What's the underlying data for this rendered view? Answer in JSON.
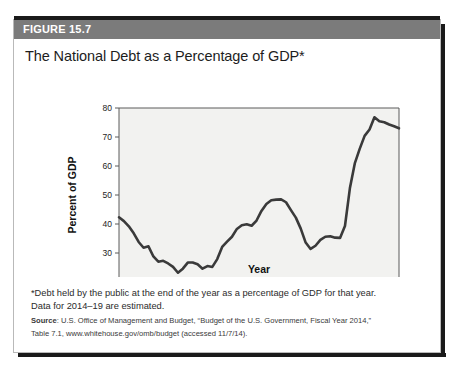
{
  "figure": {
    "label": "FIGURE 15.7",
    "title": "The National Debt as a Percentage of GDP*"
  },
  "footnote": {
    "line1": "*Debt held by the public at the end of the year as a percentage of GDP for that year.",
    "line2": "Data for 2014–19 are estimated.",
    "source_label": "Source",
    "source_rest": ": U.S. Office of Management and Budget, “Budget of the U.S. Government, Fiscal Year 2014,”",
    "source_line2": "Table 7.1, www.whitehouse.gov/omb/budget (accessed 11/7/14)."
  },
  "colors": {
    "header_bar": "#7b7b7b",
    "line": "#3a3a3a",
    "plot_bg": "#f2f2f0",
    "border": "#b9b9b9"
  },
  "chart_data": {
    "type": "line",
    "title": "The National Debt as a Percentage of GDP*",
    "xlabel": "Year",
    "ylabel": "Percent of GDP",
    "xlim": [
      1962,
      2019
    ],
    "ylim": [
      20,
      80
    ],
    "yticks": [
      20,
      30,
      40,
      50,
      60,
      70,
      80
    ],
    "xticks": [
      1962,
      1966,
      1970,
      1974,
      1978,
      1982,
      1986,
      1990,
      1994,
      1998,
      2002,
      2006,
      2010,
      2014,
      2019
    ],
    "grid": false,
    "legend": null,
    "series": [
      {
        "name": "Debt held by the public as % of GDP",
        "x": [
          1962,
          1963,
          1964,
          1965,
          1966,
          1967,
          1968,
          1969,
          1970,
          1971,
          1972,
          1973,
          1974,
          1975,
          1976,
          1977,
          1978,
          1979,
          1980,
          1981,
          1982,
          1983,
          1984,
          1985,
          1986,
          1987,
          1988,
          1989,
          1990,
          1991,
          1992,
          1993,
          1994,
          1995,
          1996,
          1997,
          1998,
          1999,
          2000,
          2001,
          2002,
          2003,
          2004,
          2005,
          2006,
          2007,
          2008,
          2009,
          2010,
          2011,
          2012,
          2013,
          2014,
          2015,
          2016,
          2017,
          2018,
          2019
        ],
        "values": [
          42.3,
          41.0,
          39.2,
          36.8,
          33.8,
          31.8,
          32.3,
          28.8,
          27.0,
          27.3,
          26.4,
          25.2,
          23.2,
          24.6,
          26.7,
          26.7,
          26.1,
          24.6,
          25.5,
          25.2,
          27.9,
          32.1,
          33.9,
          35.6,
          38.3,
          39.6,
          39.9,
          39.4,
          41.2,
          44.5,
          46.9,
          48.2,
          48.4,
          48.5,
          47.5,
          44.8,
          42.2,
          38.4,
          33.6,
          31.4,
          32.5,
          34.5,
          35.6,
          35.8,
          35.3,
          35.2,
          39.3,
          52.3,
          60.9,
          65.9,
          70.4,
          72.6,
          76.8,
          75.4,
          75.1,
          74.3,
          73.7,
          73.0
        ]
      }
    ],
    "annotations": []
  }
}
